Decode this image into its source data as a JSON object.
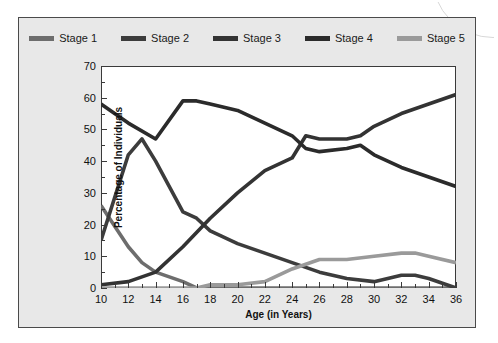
{
  "figure": {
    "background_color": "#e8e8e8",
    "border_color": "#4a4a4a",
    "plot_background_color": "#ffffff"
  },
  "legend": {
    "position": "top-center",
    "items": [
      {
        "label": "Stage 1",
        "color": "#6d6d6d",
        "swatch_name": "legend-swatch-stage-1"
      },
      {
        "label": "Stage 2",
        "color": "#3c3c3c",
        "swatch_name": "legend-swatch-stage-2"
      },
      {
        "label": "Stage 3",
        "color": "#333333",
        "swatch_name": "legend-swatch-stage-3"
      },
      {
        "label": "Stage 4",
        "color": "#2b2b2b",
        "swatch_name": "legend-swatch-stage-4"
      },
      {
        "label": "Stage 5",
        "color": "#9a9a9a",
        "swatch_name": "legend-swatch-stage-5"
      }
    ]
  },
  "chart_data": {
    "type": "line",
    "title": "",
    "xlabel": "Age (in Years)",
    "ylabel": "Percentage of Individuals",
    "x": [
      10,
      12,
      14,
      16,
      17,
      18,
      20,
      22,
      24,
      25,
      26,
      28,
      29,
      30,
      32,
      33,
      34,
      36
    ],
    "xlim": [
      10,
      36
    ],
    "xticks": [
      10,
      12,
      14,
      16,
      18,
      20,
      22,
      24,
      26,
      28,
      30,
      32,
      34,
      36
    ],
    "xtick_labels": [
      "10",
      "12",
      "14",
      "16",
      "18",
      "20",
      "22",
      "24",
      "26",
      "28",
      "30",
      "32",
      "34",
      "36"
    ],
    "x_minor_ticks": [
      11,
      13,
      15,
      17,
      19,
      21,
      23,
      25,
      27,
      29,
      31,
      33,
      35
    ],
    "ylim": [
      0,
      70
    ],
    "yticks": [
      0,
      10,
      20,
      30,
      40,
      50,
      60,
      70
    ],
    "ytick_labels": [
      "0",
      "10",
      "20",
      "30",
      "40",
      "50",
      "60",
      "70"
    ],
    "y_minor_ticks": [
      5,
      15,
      25,
      35,
      45,
      55,
      65
    ],
    "grid": false,
    "legend_position": "top-center",
    "series": [
      {
        "name": "Stage 1",
        "color": "#6d6d6d",
        "points": [
          {
            "x": 10,
            "y": 26
          },
          {
            "x": 12,
            "y": 13
          },
          {
            "x": 13,
            "y": 8
          },
          {
            "x": 14,
            "y": 5
          },
          {
            "x": 16,
            "y": 2
          },
          {
            "x": 17,
            "y": 0
          },
          {
            "x": 18,
            "y": 0
          },
          {
            "x": 20,
            "y": 0
          },
          {
            "x": 22,
            "y": 0
          },
          {
            "x": 24,
            "y": 0
          },
          {
            "x": 26,
            "y": 0
          },
          {
            "x": 28,
            "y": 0
          },
          {
            "x": 30,
            "y": 0
          },
          {
            "x": 32,
            "y": 0
          },
          {
            "x": 34,
            "y": 0
          },
          {
            "x": 36,
            "y": 0
          }
        ]
      },
      {
        "name": "Stage 2",
        "color": "#3c3c3c",
        "points": [
          {
            "x": 10,
            "y": 15
          },
          {
            "x": 12,
            "y": 42
          },
          {
            "x": 13,
            "y": 47
          },
          {
            "x": 14,
            "y": 40
          },
          {
            "x": 16,
            "y": 24
          },
          {
            "x": 17,
            "y": 22
          },
          {
            "x": 18,
            "y": 18
          },
          {
            "x": 20,
            "y": 14
          },
          {
            "x": 22,
            "y": 11
          },
          {
            "x": 24,
            "y": 8
          },
          {
            "x": 26,
            "y": 5
          },
          {
            "x": 28,
            "y": 3
          },
          {
            "x": 30,
            "y": 2
          },
          {
            "x": 32,
            "y": 4
          },
          {
            "x": 33,
            "y": 4
          },
          {
            "x": 34,
            "y": 3
          },
          {
            "x": 36,
            "y": 0
          }
        ]
      },
      {
        "name": "Stage 3",
        "color": "#333333",
        "points": [
          {
            "x": 10,
            "y": 1
          },
          {
            "x": 12,
            "y": 2
          },
          {
            "x": 14,
            "y": 5
          },
          {
            "x": 16,
            "y": 13
          },
          {
            "x": 18,
            "y": 22
          },
          {
            "x": 20,
            "y": 30
          },
          {
            "x": 22,
            "y": 37
          },
          {
            "x": 24,
            "y": 41
          },
          {
            "x": 25,
            "y": 48
          },
          {
            "x": 26,
            "y": 47
          },
          {
            "x": 28,
            "y": 47
          },
          {
            "x": 29,
            "y": 48
          },
          {
            "x": 30,
            "y": 51
          },
          {
            "x": 32,
            "y": 55
          },
          {
            "x": 34,
            "y": 58
          },
          {
            "x": 36,
            "y": 61
          }
        ]
      },
      {
        "name": "Stage 4",
        "color": "#2b2b2b",
        "points": [
          {
            "x": 10,
            "y": 58
          },
          {
            "x": 12,
            "y": 52
          },
          {
            "x": 14,
            "y": 47
          },
          {
            "x": 16,
            "y": 59
          },
          {
            "x": 17,
            "y": 59
          },
          {
            "x": 18,
            "y": 58
          },
          {
            "x": 20,
            "y": 56
          },
          {
            "x": 22,
            "y": 52
          },
          {
            "x": 24,
            "y": 48
          },
          {
            "x": 25,
            "y": 44
          },
          {
            "x": 26,
            "y": 43
          },
          {
            "x": 28,
            "y": 44
          },
          {
            "x": 29,
            "y": 45
          },
          {
            "x": 30,
            "y": 42
          },
          {
            "x": 32,
            "y": 38
          },
          {
            "x": 34,
            "y": 35
          },
          {
            "x": 36,
            "y": 32
          }
        ]
      },
      {
        "name": "Stage 5",
        "color": "#9a9a9a",
        "points": [
          {
            "x": 10,
            "y": 0
          },
          {
            "x": 12,
            "y": 0
          },
          {
            "x": 14,
            "y": 0
          },
          {
            "x": 16,
            "y": 0
          },
          {
            "x": 17,
            "y": 0
          },
          {
            "x": 18,
            "y": 1
          },
          {
            "x": 20,
            "y": 1
          },
          {
            "x": 22,
            "y": 2
          },
          {
            "x": 24,
            "y": 6
          },
          {
            "x": 26,
            "y": 9
          },
          {
            "x": 28,
            "y": 9
          },
          {
            "x": 30,
            "y": 10
          },
          {
            "x": 32,
            "y": 11
          },
          {
            "x": 33,
            "y": 11
          },
          {
            "x": 34,
            "y": 10
          },
          {
            "x": 36,
            "y": 8
          }
        ]
      }
    ]
  }
}
